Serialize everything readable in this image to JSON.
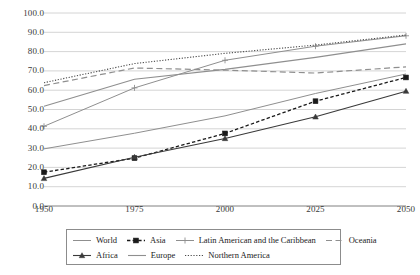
{
  "chart_data": {
    "type": "line",
    "title": "",
    "xlabel": "",
    "ylabel": "",
    "categories": [
      "1950",
      "1975",
      "2000",
      "2025",
      "2050"
    ],
    "x": [
      1950,
      1975,
      2000,
      2025,
      2050
    ],
    "xlim": [
      1950,
      2050
    ],
    "ylim": [
      0,
      100
    ],
    "grid": "horizontal",
    "legend_position": "bottom",
    "ytick_labels": [
      "100.0",
      "90.0",
      "80.0",
      "70.0",
      "60.0",
      "50.0",
      "40.0",
      "30.0",
      "20.0",
      "10.0",
      "0.0"
    ],
    "ytick_values": [
      100,
      90,
      80,
      70,
      60,
      50,
      40,
      30,
      20,
      10,
      0
    ],
    "series": [
      {
        "name": "World",
        "values": [
          29.6,
          37.7,
          46.7,
          58.3,
          68.4
        ],
        "color": "#8f8f8f",
        "dash": "none",
        "marker": "none",
        "width": 1
      },
      {
        "name": "Asia",
        "values": [
          17.5,
          24.8,
          37.6,
          54.3,
          66.6
        ],
        "color": "#1a1a1a",
        "dash": "dashed",
        "marker": "square",
        "width": 1.3
      },
      {
        "name": "Latin American and the Caribbean",
        "values": [
          41.3,
          61.2,
          75.5,
          82.8,
          88.2
        ],
        "color": "#8f8f8f",
        "dash": "none",
        "marker": "plus",
        "width": 1
      },
      {
        "name": "Oceania",
        "values": [
          62.4,
          71.5,
          70.4,
          68.9,
          72.1
        ],
        "color": "#8f8f8f",
        "dash": "longdash",
        "marker": "none",
        "width": 1.2
      },
      {
        "name": "Africa",
        "values": [
          14.3,
          25.3,
          35.0,
          46.2,
          59.5
        ],
        "color": "#3a3a3a",
        "dash": "none",
        "marker": "triangle",
        "width": 1.1
      },
      {
        "name": "Europe",
        "values": [
          51.7,
          65.7,
          70.8,
          77.0,
          84.0
        ],
        "color": "#8f8f8f",
        "dash": "none",
        "marker": "none",
        "width": 1.1
      },
      {
        "name": "Northern America",
        "values": [
          63.9,
          73.8,
          79.1,
          83.4,
          88.6
        ],
        "color": "#4a4a4a",
        "dash": "dotted",
        "marker": "none",
        "width": 1.1
      }
    ]
  },
  "legend": {
    "rows": [
      [
        "World",
        "Asia",
        "Latin American and the Caribbean",
        "Oceania"
      ],
      [
        "Africa",
        "Europe",
        "Northern America"
      ]
    ]
  },
  "colors": {
    "gridline": "#c9c9c9",
    "axis": "#8c8c8c",
    "tick_text": "#3a3a3a",
    "legend_border": "#8c8c8c",
    "background": "#ffffff"
  }
}
